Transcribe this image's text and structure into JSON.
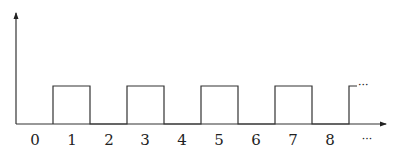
{
  "diagram": {
    "type": "square-wave",
    "x_labels": [
      "0",
      "1",
      "2",
      "3",
      "4",
      "5",
      "6",
      "7",
      "8",
      "..."
    ],
    "continuation_marker": "···",
    "pulses": [
      {
        "start": 0.5,
        "end": 1.5
      },
      {
        "start": 2.5,
        "end": 3.5
      },
      {
        "start": 4.5,
        "end": 5.5
      },
      {
        "start": 6.5,
        "end": 7.5
      },
      {
        "start": 8.5,
        "end": null
      }
    ],
    "colors": {
      "line": "#333333",
      "text": "#222222",
      "background": "#ffffff"
    }
  }
}
